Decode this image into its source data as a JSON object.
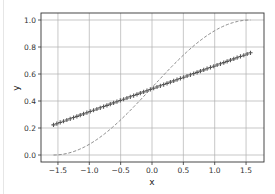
{
  "chart_data": {
    "type": "line",
    "title": "",
    "xlabel": "x",
    "ylabel": "y",
    "xlim": [
      -1.75,
      1.78
    ],
    "ylim": [
      -0.05,
      1.05
    ],
    "x_ticks": [
      -1.5,
      -1.0,
      -0.5,
      0.0,
      0.5,
      1.0,
      1.5
    ],
    "x_tick_labels": [
      "−1.5",
      "−1.0",
      "−0.5",
      "0.0",
      "0.5",
      "1.0",
      "1.5"
    ],
    "y_ticks": [
      0.0,
      0.2,
      0.4,
      0.6,
      0.8,
      1.0
    ],
    "y_tick_labels": [
      "0.0",
      "0.2",
      "0.4",
      "0.6",
      "0.8",
      "1.0"
    ],
    "grid": true,
    "legend": null,
    "series": [
      {
        "name": "dashed curve",
        "style": "dashed",
        "color": "#808080",
        "formula": "(sin(x)+1)/2",
        "x_range": [
          -1.5708,
          1.5708
        ],
        "samples": [
          {
            "x": -1.5,
            "y": 0.001
          },
          {
            "x": -1.0,
            "y": 0.079
          },
          {
            "x": -0.5,
            "y": 0.26
          },
          {
            "x": 0.0,
            "y": 0.5
          },
          {
            "x": 0.5,
            "y": 0.74
          },
          {
            "x": 1.0,
            "y": 0.921
          },
          {
            "x": 1.5,
            "y": 0.999
          }
        ]
      },
      {
        "name": "marker line",
        "style": "plus-markers",
        "color": "#555555",
        "formula": "0.49 + 0.17*x",
        "x_range": [
          -1.5708,
          1.5708
        ],
        "n_points": 60,
        "samples": [
          {
            "x": -1.57,
            "y": 0.22
          },
          {
            "x": -1.0,
            "y": 0.32
          },
          {
            "x": -0.5,
            "y": 0.405
          },
          {
            "x": 0.0,
            "y": 0.49
          },
          {
            "x": 0.5,
            "y": 0.575
          },
          {
            "x": 1.0,
            "y": 0.66
          },
          {
            "x": 1.57,
            "y": 0.757
          }
        ]
      }
    ]
  },
  "colors": {
    "axes": "#333333",
    "grid": "#b0b0b0",
    "dashed": "#808080",
    "markers": "#555555"
  }
}
